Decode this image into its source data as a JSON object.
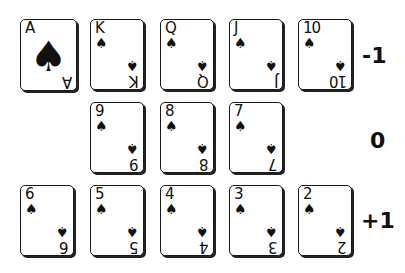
{
  "suit_symbol": "♠",
  "rows": [
    {
      "value_label": "-1",
      "cards": [
        {
          "rank": "A",
          "ace": true
        },
        {
          "rank": "K"
        },
        {
          "rank": "Q"
        },
        {
          "rank": "J"
        },
        {
          "rank": "10"
        }
      ]
    },
    {
      "value_label": "0",
      "cards": [
        {
          "rank": "9"
        },
        {
          "rank": "8"
        },
        {
          "rank": "7"
        }
      ]
    },
    {
      "value_label": "+1",
      "cards": [
        {
          "rank": "6"
        },
        {
          "rank": "5"
        },
        {
          "rank": "4"
        },
        {
          "rank": "3"
        },
        {
          "rank": "2"
        }
      ]
    }
  ]
}
